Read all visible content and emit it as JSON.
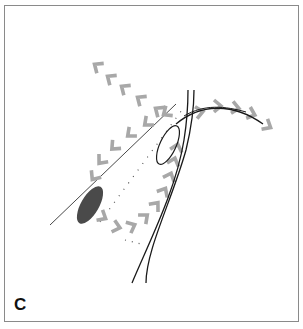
{
  "figure": {
    "panel_label": "C",
    "colors": {
      "border": "#8a8a8a",
      "chevron": "#a8a8a8",
      "line": "#222222",
      "oval_fill": "#4a4a4a",
      "dotted": "#555555"
    },
    "elements": {
      "straight_line": {
        "x1": 50,
        "y1": 225,
        "x2": 176,
        "y2": 104
      },
      "dotted_line": {
        "x1": 100,
        "y1": 222,
        "x2": 182,
        "y2": 110
      },
      "dark_oval": {
        "cx": 90,
        "cy": 205,
        "rx": 9,
        "ry": 21,
        "rotate": 30
      },
      "open_loop": {
        "cx": 170,
        "cy": 143,
        "rx": 9,
        "ry": 22,
        "rotate": 25
      },
      "duct_left": "M132,283 C150,240 176,190 184,140 C188,115 188,100 188,90",
      "duct_right": "M146,283 C146,250 172,200 186,150 C192,125 194,105 194,90",
      "curve_right": "M185,120 C205,100 235,100 263,124"
    },
    "chevron_paths": [
      {
        "name": "upper-left-path",
        "direction": "up-left",
        "points": [
          [
            97,
            66
          ],
          [
            110,
            78
          ],
          [
            124,
            88
          ],
          [
            140,
            99
          ],
          [
            158,
            110
          ]
        ]
      },
      {
        "name": "mid-left-path",
        "direction": "down-left",
        "points": [
          [
            168,
            112
          ],
          [
            148,
            122
          ],
          [
            130,
            133
          ],
          [
            114,
            146
          ],
          [
            100,
            160
          ],
          [
            95,
            176
          ]
        ]
      },
      {
        "name": "lower-curve-path",
        "direction": "up-right",
        "points": [
          [
            103,
            218
          ],
          [
            118,
            228
          ],
          [
            133,
            226
          ],
          [
            146,
            216
          ],
          [
            157,
            204
          ],
          [
            165,
            190
          ],
          [
            171,
            176
          ],
          [
            175,
            160
          ],
          [
            178,
            146
          ]
        ]
      },
      {
        "name": "right-path",
        "direction": "right",
        "points": [
          [
            200,
            112
          ],
          [
            218,
            105
          ],
          [
            236,
            108
          ],
          [
            252,
            114
          ],
          [
            267,
            126
          ]
        ]
      }
    ]
  }
}
